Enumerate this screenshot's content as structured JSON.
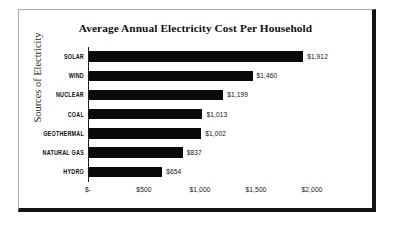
{
  "chart_data": {
    "type": "bar",
    "orientation": "horizontal",
    "title": "Average Annual Electricity Cost Per Household",
    "xlabel": "",
    "ylabel": "Sources of Electricity",
    "categories": [
      "SOLAR",
      "WIND",
      "NUCLEAR",
      "COAL",
      "GEOTHERMAL",
      "NATURAL GAS",
      "HYDRO"
    ],
    "values": [
      1912,
      1460,
      1199,
      1013,
      1002,
      837,
      654
    ],
    "value_labels": [
      "$1,912",
      "$1,460",
      "$1,199",
      "$1,013",
      "$1,002",
      "$837",
      "$654"
    ],
    "xlim": [
      0,
      2000
    ],
    "x_tick_values": [
      0,
      500,
      1000,
      1500,
      2000
    ],
    "x_tick_labels": [
      "$-",
      "$500",
      "$1,000",
      "$1,500",
      "$2,000"
    ],
    "grid": false,
    "legend": false,
    "bar_color": "#0a0a0a",
    "plot_background": "#ffffff"
  },
  "frame": {
    "border_light": "#a8a8a8",
    "border_dark": "#141414"
  }
}
